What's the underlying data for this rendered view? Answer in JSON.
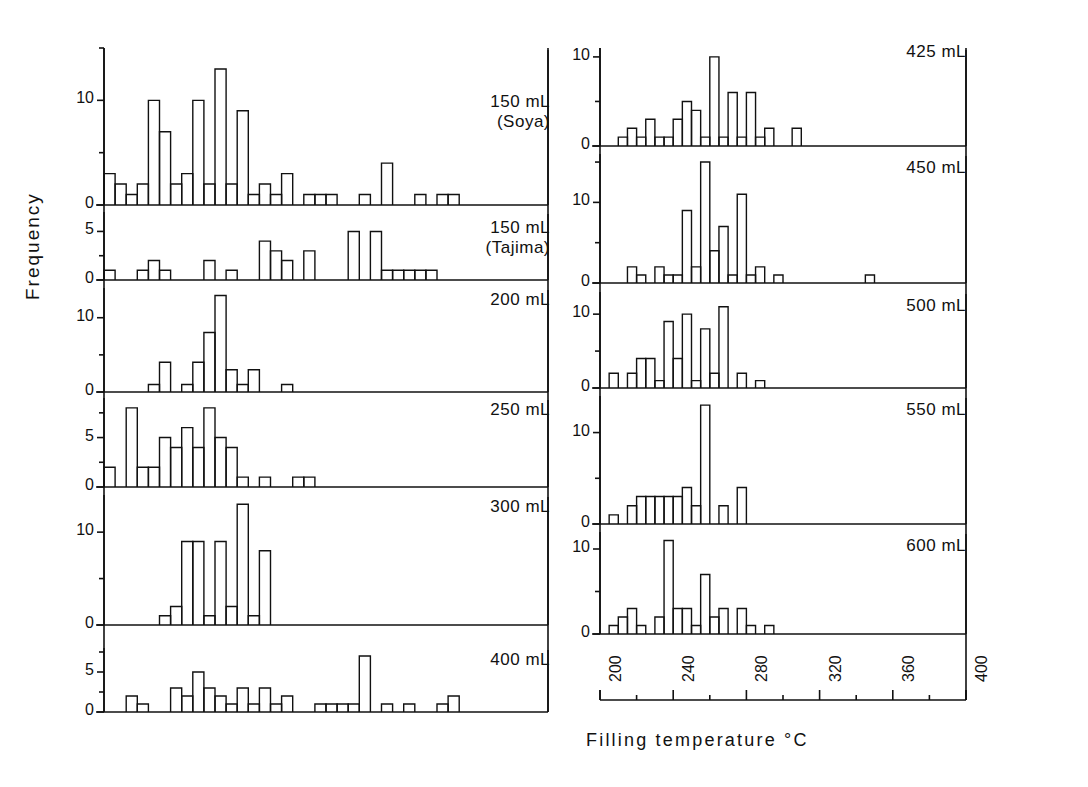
{
  "figure": {
    "xlabel": "Filling  temperature     °C",
    "ylabel": "Frequency",
    "xunit": "°C"
  },
  "axis": {
    "x_major_ticks": [
      "200",
      "240",
      "280",
      "320",
      "360",
      "400"
    ],
    "x_min": 200,
    "x_max": 400,
    "x_minor_step": 20,
    "x_major_step": 40
  },
  "panels": {
    "left": [
      {
        "label_line1": "150 mL",
        "label_line2": "(Soya)",
        "ymax": 15,
        "yticks": [
          0,
          10
        ]
      },
      {
        "label_line1": "150 mL",
        "label_line2": "(Tajima)",
        "ymax": 7,
        "yticks": [
          0,
          5
        ]
      },
      {
        "label_line1": "200 mL",
        "label_line2": "",
        "ymax": 14,
        "yticks": [
          0,
          10
        ]
      },
      {
        "label_line1": "250 mL",
        "label_line2": "",
        "ymax": 9,
        "yticks": [
          0,
          5
        ]
      },
      {
        "label_line1": "300 mL",
        "label_line2": "",
        "ymax": 14,
        "yticks": [
          0,
          10
        ]
      },
      {
        "label_line1": "400 mL",
        "label_line2": "",
        "ymax": 8,
        "yticks": [
          0,
          5
        ]
      }
    ],
    "right": [
      {
        "label_line1": "425 mL",
        "label_line2": "",
        "ymax": 11,
        "yticks": [
          0,
          10
        ]
      },
      {
        "label_line1": "450 mL",
        "label_line2": "",
        "ymax": 16,
        "yticks": [
          0,
          10
        ]
      },
      {
        "label_line1": "500 mL",
        "label_line2": "",
        "ymax": 13,
        "yticks": [
          0,
          10
        ]
      },
      {
        "label_line1": "550 mL",
        "label_line2": "",
        "ymax": 14,
        "yticks": [
          0,
          10
        ]
      },
      {
        "label_line1": "600 mL",
        "label_line2": "",
        "ymax": 12,
        "yticks": [
          0,
          10
        ]
      }
    ]
  },
  "chart_data": {
    "type": "bar",
    "title": "",
    "xlabel": "Filling temperature °C",
    "ylabel": "Frequency",
    "xlim": [
      200,
      400
    ],
    "bin_width": 5,
    "grid": false,
    "legend": "none",
    "note": "Eleven stacked histogram panels of filling temperature, one per container volume. Each series lists [bin_start_temperature, frequency] pairs; bin width 5 °C.",
    "series": [
      {
        "name": "150 mL (Soya)",
        "ylim": [
          0,
          15
        ],
        "yticks": [
          0,
          10
        ],
        "bins": [
          [
            200,
            3
          ],
          [
            205,
            2
          ],
          [
            210,
            1
          ],
          [
            215,
            2
          ],
          [
            220,
            10
          ],
          [
            225,
            7
          ],
          [
            230,
            2
          ],
          [
            235,
            3
          ],
          [
            240,
            10
          ],
          [
            245,
            2
          ],
          [
            250,
            13
          ],
          [
            255,
            2
          ],
          [
            260,
            9
          ],
          [
            265,
            1
          ],
          [
            270,
            2
          ],
          [
            275,
            1
          ],
          [
            280,
            3
          ],
          [
            290,
            1
          ],
          [
            295,
            1
          ],
          [
            300,
            1
          ],
          [
            315,
            1
          ],
          [
            325,
            4
          ],
          [
            340,
            1
          ],
          [
            350,
            1
          ],
          [
            355,
            1
          ]
        ]
      },
      {
        "name": "150 mL (Tajima)",
        "ylim": [
          0,
          7
        ],
        "yticks": [
          0,
          5
        ],
        "bins": [
          [
            200,
            1
          ],
          [
            215,
            1
          ],
          [
            220,
            2
          ],
          [
            225,
            1
          ],
          [
            245,
            2
          ],
          [
            255,
            1
          ],
          [
            270,
            4
          ],
          [
            275,
            3
          ],
          [
            280,
            2
          ],
          [
            290,
            3
          ],
          [
            310,
            5
          ],
          [
            320,
            5
          ],
          [
            325,
            1
          ],
          [
            330,
            1
          ],
          [
            335,
            1
          ],
          [
            340,
            1
          ],
          [
            345,
            1
          ]
        ]
      },
      {
        "name": "200 mL",
        "ylim": [
          0,
          14
        ],
        "yticks": [
          0,
          10
        ],
        "bins": [
          [
            220,
            1
          ],
          [
            225,
            4
          ],
          [
            235,
            1
          ],
          [
            240,
            4
          ],
          [
            245,
            8
          ],
          [
            250,
            13
          ],
          [
            255,
            3
          ],
          [
            260,
            1
          ],
          [
            265,
            3
          ],
          [
            280,
            1
          ]
        ]
      },
      {
        "name": "250 mL",
        "ylim": [
          0,
          9
        ],
        "yticks": [
          0,
          5
        ],
        "bins": [
          [
            200,
            2
          ],
          [
            210,
            8
          ],
          [
            215,
            2
          ],
          [
            220,
            2
          ],
          [
            225,
            5
          ],
          [
            230,
            4
          ],
          [
            235,
            6
          ],
          [
            240,
            4
          ],
          [
            245,
            8
          ],
          [
            250,
            5
          ],
          [
            255,
            4
          ],
          [
            260,
            1
          ],
          [
            270,
            1
          ],
          [
            285,
            1
          ],
          [
            290,
            1
          ]
        ]
      },
      {
        "name": "300 mL",
        "ylim": [
          0,
          14
        ],
        "yticks": [
          0,
          10
        ],
        "bins": [
          [
            225,
            1
          ],
          [
            230,
            2
          ],
          [
            235,
            9
          ],
          [
            240,
            9
          ],
          [
            245,
            1
          ],
          [
            250,
            9
          ],
          [
            255,
            2
          ],
          [
            260,
            13
          ],
          [
            265,
            1
          ],
          [
            270,
            8
          ]
        ]
      },
      {
        "name": "400 mL",
        "ylim": [
          0,
          8
        ],
        "yticks": [
          0,
          5
        ],
        "bins": [
          [
            210,
            2
          ],
          [
            215,
            1
          ],
          [
            230,
            3
          ],
          [
            235,
            2
          ],
          [
            240,
            5
          ],
          [
            245,
            3
          ],
          [
            250,
            2
          ],
          [
            255,
            1
          ],
          [
            260,
            3
          ],
          [
            265,
            1
          ],
          [
            270,
            3
          ],
          [
            275,
            1
          ],
          [
            280,
            2
          ],
          [
            295,
            1
          ],
          [
            300,
            1
          ],
          [
            305,
            1
          ],
          [
            310,
            1
          ],
          [
            315,
            7
          ],
          [
            325,
            1
          ],
          [
            335,
            1
          ],
          [
            350,
            1
          ],
          [
            355,
            2
          ]
        ]
      },
      {
        "name": "425 mL",
        "ylim": [
          0,
          11
        ],
        "yticks": [
          0,
          10
        ],
        "bins": [
          [
            210,
            1
          ],
          [
            215,
            2
          ],
          [
            220,
            1
          ],
          [
            225,
            3
          ],
          [
            230,
            1
          ],
          [
            235,
            1
          ],
          [
            240,
            3
          ],
          [
            245,
            5
          ],
          [
            250,
            4
          ],
          [
            255,
            1
          ],
          [
            260,
            10
          ],
          [
            265,
            1
          ],
          [
            270,
            6
          ],
          [
            275,
            1
          ],
          [
            280,
            6
          ],
          [
            285,
            1
          ],
          [
            290,
            2
          ],
          [
            305,
            2
          ]
        ]
      },
      {
        "name": "450 mL",
        "ylim": [
          0,
          16
        ],
        "yticks": [
          0,
          10
        ],
        "bins": [
          [
            215,
            2
          ],
          [
            220,
            1
          ],
          [
            230,
            2
          ],
          [
            235,
            1
          ],
          [
            240,
            1
          ],
          [
            245,
            9
          ],
          [
            250,
            2
          ],
          [
            255,
            15
          ],
          [
            260,
            4
          ],
          [
            265,
            7
          ],
          [
            270,
            1
          ],
          [
            275,
            11
          ],
          [
            280,
            1
          ],
          [
            285,
            2
          ],
          [
            295,
            1
          ],
          [
            345,
            1
          ]
        ]
      },
      {
        "name": "500 mL",
        "ylim": [
          0,
          13
        ],
        "yticks": [
          0,
          10
        ],
        "bins": [
          [
            205,
            2
          ],
          [
            215,
            2
          ],
          [
            220,
            4
          ],
          [
            225,
            4
          ],
          [
            230,
            1
          ],
          [
            235,
            9
          ],
          [
            240,
            4
          ],
          [
            245,
            10
          ],
          [
            250,
            1
          ],
          [
            255,
            8
          ],
          [
            260,
            2
          ],
          [
            265,
            11
          ],
          [
            275,
            2
          ],
          [
            285,
            1
          ]
        ]
      },
      {
        "name": "550 mL",
        "ylim": [
          0,
          14
        ],
        "yticks": [
          0,
          10
        ],
        "bins": [
          [
            205,
            1
          ],
          [
            215,
            2
          ],
          [
            220,
            3
          ],
          [
            225,
            3
          ],
          [
            230,
            3
          ],
          [
            235,
            3
          ],
          [
            240,
            3
          ],
          [
            245,
            4
          ],
          [
            250,
            2
          ],
          [
            255,
            13
          ],
          [
            265,
            2
          ],
          [
            275,
            4
          ]
        ]
      },
      {
        "name": "600 mL",
        "ylim": [
          0,
          12
        ],
        "yticks": [
          0,
          10
        ],
        "bins": [
          [
            205,
            1
          ],
          [
            210,
            2
          ],
          [
            215,
            3
          ],
          [
            220,
            1
          ],
          [
            230,
            2
          ],
          [
            235,
            11
          ],
          [
            240,
            3
          ],
          [
            245,
            3
          ],
          [
            250,
            1
          ],
          [
            255,
            7
          ],
          [
            260,
            2
          ],
          [
            265,
            3
          ],
          [
            275,
            3
          ],
          [
            280,
            1
          ],
          [
            290,
            1
          ]
        ]
      }
    ]
  }
}
